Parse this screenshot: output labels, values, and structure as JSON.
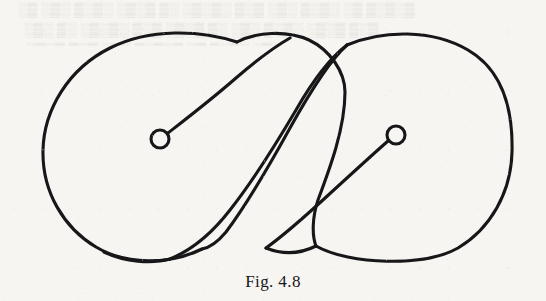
{
  "page": {
    "background_color": "#f6f5f1",
    "ink_color": "#17171a",
    "width": 546,
    "height": 301
  },
  "bleed_through": {
    "description": "very faint mirrored show-through text from the reverse page, illegible",
    "line1": "░▒ ░▒░ ▒░▒░ ░▒░▒ ▒░ ░▒░▒░ ▒░▒ ░▒░ ▒░▒░ ░▒ ▒░▒░▒",
    "line2": "░▒░ ▒░ ░▒░▒░ ▒░▒ ░▒░▒ ▒░ ░▒░ ▒░▒░ ░▒░▒ ▒░▒",
    "line3": "░▒░▒ ▒░▒ ░▒░ ▒░▒░▒ ░▒ ▒░▒░ ░▒░"
  },
  "figure": {
    "caption": "Fig. 4.8",
    "type": "line-drawing",
    "stroke_color": "#17171a",
    "stroke_width": 3.1,
    "elements": {
      "outer_left_lobe": "large rounded lobe spanning x 43–240, y 30–266",
      "outer_right_lobe": "large rounded lobe spanning x 312–512, y 30–266",
      "middle_lobe": "central lobe spanning x 232–352, y 38–262",
      "s_band": "S-shaped diagonal band crossing the centre from upper-right to lower-left",
      "left_spiral": {
        "center_x": 160,
        "center_y": 139,
        "radius": 9
      },
      "right_spiral": {
        "center_x": 396,
        "center_y": 135,
        "radius": 9
      },
      "crossings": [
        {
          "x": 237,
          "y": 42
        },
        {
          "x": 347,
          "y": 45
        },
        {
          "x": 202,
          "y": 249
        },
        {
          "x": 316,
          "y": 246
        }
      ]
    }
  }
}
